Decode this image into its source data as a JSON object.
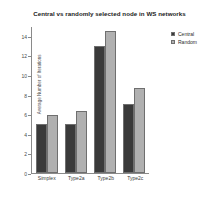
{
  "chart_data": {
    "type": "bar",
    "title": "Central vs randomly selected node in WS networks",
    "xlabel": "",
    "ylabel": "Average Number of Iterations",
    "categories": [
      "Simplex",
      "Type2a",
      "Type2b",
      "Type2c"
    ],
    "series": [
      {
        "name": "Central",
        "color": "#3a3a3a",
        "values": [
          5.0,
          5.0,
          13.0,
          7.0
        ]
      },
      {
        "name": "Random",
        "color": "#b0b0b0",
        "values": [
          5.9,
          6.3,
          14.5,
          8.7
        ]
      }
    ],
    "ylim": [
      0,
      15
    ],
    "yticks": [
      0,
      2,
      4,
      6,
      8,
      10,
      12,
      14
    ],
    "ytick_labels": [
      "0",
      "2",
      "4",
      "6",
      "8",
      "10",
      "12",
      "14"
    ],
    "grid": false,
    "legend_position": "top-right"
  }
}
